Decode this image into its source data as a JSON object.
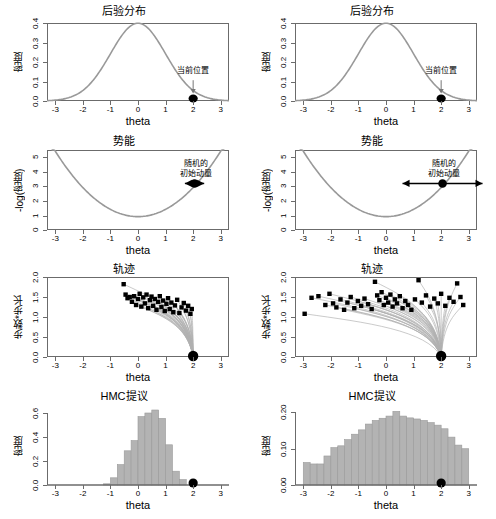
{
  "figure": {
    "xlabel": "theta",
    "columns": [
      "left",
      "right"
    ],
    "rows": 4
  },
  "chart_data": [
    {
      "id": "posterior-left",
      "type": "line",
      "title": "后验分布",
      "xlabel": "theta",
      "ylabel": "密度",
      "xlim": [
        -3.3,
        3.3
      ],
      "ylim": [
        0,
        0.4
      ],
      "xticks": [
        "-3",
        "-2",
        "-1",
        "0",
        "1",
        "2",
        "3"
      ],
      "xtickvals": [
        -3,
        -2,
        -1,
        0,
        1,
        2,
        3
      ],
      "yticks": [
        "0.0",
        "0.1",
        "0.2",
        "0.3",
        "0.4"
      ],
      "ytickvals": [
        0.0,
        0.1,
        0.2,
        0.3,
        0.4
      ],
      "curve": "standard normal density, mean 0, sd 1, peak 0.399 at theta=0",
      "grid": false,
      "points": [
        {
          "x": 2.0,
          "y": 0.0,
          "label": "current position"
        }
      ],
      "annotations": [
        {
          "text": "当前位置",
          "x": 2.0,
          "y": 0.13,
          "arrow": "down"
        }
      ]
    },
    {
      "id": "posterior-right",
      "type": "line",
      "title": "后验分布",
      "xlabel": "theta",
      "ylabel": "密度",
      "xlim": [
        -3.3,
        3.3
      ],
      "ylim": [
        0,
        0.4
      ],
      "xticks": [
        "-3",
        "-2",
        "-1",
        "0",
        "1",
        "2",
        "3"
      ],
      "xtickvals": [
        -3,
        -2,
        -1,
        0,
        1,
        2,
        3
      ],
      "yticks": [
        "0.0",
        "0.1",
        "0.2",
        "0.3",
        "0.4"
      ],
      "ytickvals": [
        0.0,
        0.1,
        0.2,
        0.3,
        0.4
      ],
      "curve": "standard normal density, mean 0, sd 1, peak 0.399 at theta=0",
      "grid": false,
      "points": [
        {
          "x": 2.0,
          "y": 0.0,
          "label": "current position"
        }
      ],
      "annotations": [
        {
          "text": "当前位置",
          "x": 2.0,
          "y": 0.13,
          "arrow": "down"
        }
      ]
    },
    {
      "id": "potential-left",
      "type": "line",
      "title": "势能",
      "xlabel": "theta",
      "ylabel": "-log(密度)",
      "xlim": [
        -3.3,
        3.3
      ],
      "ylim": [
        0,
        5.5
      ],
      "xticks": [
        "-3",
        "-2",
        "-1",
        "0",
        "1",
        "2",
        "3"
      ],
      "xtickvals": [
        -3,
        -2,
        -1,
        0,
        1,
        2,
        3
      ],
      "yticks": [
        "0",
        "1",
        "2",
        "3",
        "4",
        "5"
      ],
      "ytickvals": [
        0,
        1,
        2,
        3,
        4,
        5
      ],
      "curve": "parabola U = 0.5*theta^2 + 0.919, minimum 0.92 at theta=0",
      "grid": false,
      "points": [
        {
          "x": 2.05,
          "y": 3.2,
          "label": "particle"
        }
      ],
      "annotations": [
        {
          "text_line1": "随机的",
          "text_line2": "初始动量",
          "x": 2.1,
          "y": 4.3,
          "arrow": "double-horizontal",
          "arrow_halfwidth": 0.35
        }
      ]
    },
    {
      "id": "potential-right",
      "type": "line",
      "title": "势能",
      "xlabel": "theta",
      "ylabel": "-log(密度)",
      "xlim": [
        -3.3,
        3.3
      ],
      "ylim": [
        0,
        5.5
      ],
      "xticks": [
        "-3",
        "-2",
        "-1",
        "0",
        "1",
        "2",
        "3"
      ],
      "xtickvals": [
        -3,
        -2,
        -1,
        0,
        1,
        2,
        3
      ],
      "yticks": [
        "0",
        "1",
        "2",
        "3",
        "4",
        "5"
      ],
      "ytickvals": [
        0,
        1,
        2,
        3,
        4,
        5
      ],
      "curve": "parabola U = 0.5*theta^2 + 0.919, minimum 0.92 at theta=0",
      "grid": false,
      "points": [
        {
          "x": 2.05,
          "y": 3.2,
          "label": "particle"
        }
      ],
      "annotations": [
        {
          "text_line1": "随机的",
          "text_line2": "初始动量",
          "x": 2.1,
          "y": 4.3,
          "arrow": "double-horizontal",
          "arrow_halfwidth": 1.45
        }
      ]
    },
    {
      "id": "trajectory-left",
      "type": "line",
      "title": "轨迹",
      "xlabel": "theta",
      "ylabel": "步数*步长",
      "xlim": [
        -3.3,
        3.3
      ],
      "ylim": [
        0,
        2.0
      ],
      "xticks": [
        "-3",
        "-2",
        "-1",
        "0",
        "1",
        "2",
        "3"
      ],
      "xtickvals": [
        -3,
        -2,
        -1,
        0,
        1,
        2,
        3
      ],
      "yticks": [
        "0.0",
        "0.5",
        "1.0",
        "1.5",
        "2.0"
      ],
      "ytickvals": [
        0.0,
        0.5,
        1.0,
        1.5,
        2.0
      ],
      "grid": false,
      "description": "short leapfrog trajectories fanning from start point up and to the left, endpoints clustered near theta -0.6 to 2.0",
      "start_point": {
        "x": 2.0,
        "y": 0.0
      },
      "endpoints": [
        {
          "x": -0.52,
          "y": 1.82
        },
        {
          "x": -0.45,
          "y": 1.56
        },
        {
          "x": -0.38,
          "y": 1.47
        },
        {
          "x": -0.3,
          "y": 1.5
        },
        {
          "x": -0.22,
          "y": 1.38
        },
        {
          "x": -0.14,
          "y": 1.52
        },
        {
          "x": -0.07,
          "y": 1.3
        },
        {
          "x": 0.0,
          "y": 1.45
        },
        {
          "x": 0.06,
          "y": 1.58
        },
        {
          "x": 0.12,
          "y": 1.26
        },
        {
          "x": 0.19,
          "y": 1.49
        },
        {
          "x": 0.25,
          "y": 1.34
        },
        {
          "x": 0.31,
          "y": 1.56
        },
        {
          "x": 0.37,
          "y": 1.22
        },
        {
          "x": 0.43,
          "y": 1.42
        },
        {
          "x": 0.49,
          "y": 1.51
        },
        {
          "x": 0.55,
          "y": 1.28
        },
        {
          "x": 0.61,
          "y": 1.45
        },
        {
          "x": 0.67,
          "y": 1.18
        },
        {
          "x": 0.73,
          "y": 1.38
        },
        {
          "x": 0.79,
          "y": 1.52
        },
        {
          "x": 0.85,
          "y": 1.25
        },
        {
          "x": 0.91,
          "y": 1.41
        },
        {
          "x": 0.97,
          "y": 1.15
        },
        {
          "x": 1.03,
          "y": 1.33
        },
        {
          "x": 1.09,
          "y": 1.47
        },
        {
          "x": 1.15,
          "y": 1.2
        },
        {
          "x": 1.21,
          "y": 1.36
        },
        {
          "x": 1.28,
          "y": 1.12
        },
        {
          "x": 1.34,
          "y": 1.29
        },
        {
          "x": 1.42,
          "y": 1.43
        },
        {
          "x": 1.5,
          "y": 1.1
        },
        {
          "x": 1.58,
          "y": 1.24
        },
        {
          "x": 1.66,
          "y": 1.35
        },
        {
          "x": 1.74,
          "y": 1.16
        },
        {
          "x": 1.82,
          "y": 1.28
        },
        {
          "x": 1.9,
          "y": 1.08
        },
        {
          "x": 1.95,
          "y": 1.2
        }
      ]
    },
    {
      "id": "trajectory-right",
      "type": "line",
      "title": "轨迹",
      "xlabel": "theta",
      "ylabel": "步数*步长",
      "xlim": [
        -3.3,
        3.3
      ],
      "ylim": [
        0,
        2.0
      ],
      "xticks": [
        "-3",
        "-2",
        "-1",
        "0",
        "1",
        "2",
        "3"
      ],
      "xtickvals": [
        -3,
        -2,
        -1,
        0,
        1,
        2,
        3
      ],
      "yticks": [
        "0.0",
        "0.5",
        "1.0",
        "1.5",
        "2.0"
      ],
      "ytickvals": [
        0.0,
        0.5,
        1.0,
        1.5,
        2.0
      ],
      "grid": false,
      "description": "long leapfrog trajectories fanning from start point across the full theta range, endpoints spread from -3 to 2.8",
      "start_point": {
        "x": 2.0,
        "y": 0.0
      },
      "endpoints": [
        {
          "x": -2.95,
          "y": 1.08
        },
        {
          "x": -2.7,
          "y": 1.48
        },
        {
          "x": -2.45,
          "y": 1.52
        },
        {
          "x": -2.2,
          "y": 1.3
        },
        {
          "x": -2.05,
          "y": 1.58
        },
        {
          "x": -1.92,
          "y": 1.34
        },
        {
          "x": -1.8,
          "y": 1.24
        },
        {
          "x": -1.65,
          "y": 1.44
        },
        {
          "x": -1.52,
          "y": 1.18
        },
        {
          "x": -1.4,
          "y": 1.36
        },
        {
          "x": -1.28,
          "y": 1.5
        },
        {
          "x": -1.15,
          "y": 1.22
        },
        {
          "x": -1.02,
          "y": 1.4
        },
        {
          "x": -0.9,
          "y": 1.28
        },
        {
          "x": -0.78,
          "y": 1.46
        },
        {
          "x": -0.65,
          "y": 1.32
        },
        {
          "x": -0.52,
          "y": 1.2
        },
        {
          "x": -0.4,
          "y": 1.88
        },
        {
          "x": -0.32,
          "y": 1.54
        },
        {
          "x": -0.24,
          "y": 1.42
        },
        {
          "x": -0.16,
          "y": 1.62
        },
        {
          "x": -0.08,
          "y": 1.3
        },
        {
          "x": 0.0,
          "y": 1.48
        },
        {
          "x": 0.08,
          "y": 1.36
        },
        {
          "x": 0.16,
          "y": 1.56
        },
        {
          "x": 0.24,
          "y": 1.26
        },
        {
          "x": 0.32,
          "y": 1.44
        },
        {
          "x": 0.4,
          "y": 1.34
        },
        {
          "x": 0.5,
          "y": 1.52
        },
        {
          "x": 0.6,
          "y": 1.22
        },
        {
          "x": 0.7,
          "y": 1.4
        },
        {
          "x": 0.8,
          "y": 1.3
        },
        {
          "x": 0.92,
          "y": 1.18
        },
        {
          "x": 1.05,
          "y": 1.44
        },
        {
          "x": 1.18,
          "y": 1.92
        },
        {
          "x": 1.3,
          "y": 1.36
        },
        {
          "x": 1.45,
          "y": 1.54
        },
        {
          "x": 1.6,
          "y": 1.26
        },
        {
          "x": 1.75,
          "y": 1.46
        },
        {
          "x": 1.88,
          "y": 1.34
        },
        {
          "x": 2.0,
          "y": 1.58
        },
        {
          "x": 2.15,
          "y": 1.28
        },
        {
          "x": 2.3,
          "y": 1.48
        },
        {
          "x": 2.45,
          "y": 1.38
        },
        {
          "x": 2.58,
          "y": 1.84
        },
        {
          "x": 2.7,
          "y": 1.5
        },
        {
          "x": 2.8,
          "y": 1.3
        }
      ]
    },
    {
      "id": "hmc-proposal-left",
      "type": "bar",
      "title": "HMC提议",
      "xlabel": "theta",
      "ylabel": "密度",
      "xlim": [
        -3.3,
        3.3
      ],
      "ylim": [
        0,
        0.65
      ],
      "xticks": [
        "-3",
        "-2",
        "-1",
        "0",
        "1",
        "2",
        "3"
      ],
      "xtickvals": [
        -3,
        -2,
        -1,
        0,
        1,
        2,
        3
      ],
      "yticks": [
        "0.0",
        "0.2",
        "0.4",
        "0.6"
      ],
      "ytickvals": [
        0.0,
        0.2,
        0.4,
        0.6
      ],
      "grid": false,
      "bin_width": 0.25,
      "bin_starts": [
        -1.25,
        -1.0,
        -0.75,
        -0.5,
        -0.25,
        0.0,
        0.25,
        0.5,
        0.75,
        1.0,
        1.25,
        1.5
      ],
      "categories": [
        "-1.25",
        "-1.00",
        "-0.75",
        "-0.50",
        "-0.25",
        "0.00",
        "0.25",
        "0.50",
        "0.75",
        "1.00",
        "1.25",
        "1.50"
      ],
      "values": [
        0.01,
        0.06,
        0.17,
        0.285,
        0.37,
        0.57,
        0.6,
        0.625,
        0.555,
        0.335,
        0.115,
        0.045
      ],
      "points": [
        {
          "x": 2.0,
          "y": 0.0,
          "label": "current position"
        }
      ]
    },
    {
      "id": "hmc-proposal-right",
      "type": "bar",
      "title": "HMC提议",
      "xlabel": "theta",
      "ylabel": "密度",
      "xlim": [
        -3.3,
        3.3
      ],
      "ylim": [
        0,
        0.215
      ],
      "xticks": [
        "-3",
        "-2",
        "-1",
        "0",
        "1",
        "2",
        "3"
      ],
      "xtickvals": [
        -3,
        -2,
        -1,
        0,
        1,
        2,
        3
      ],
      "yticks": [
        "0.00",
        "0.10",
        "0.20"
      ],
      "ytickvals": [
        0.0,
        0.1,
        0.2
      ],
      "grid": false,
      "bin_width": 0.25,
      "bin_starts": [
        -3.0,
        -2.75,
        -2.5,
        -2.25,
        -2.0,
        -1.75,
        -1.5,
        -1.25,
        -1.0,
        -0.75,
        -0.5,
        -0.25,
        0.0,
        0.25,
        0.5,
        0.75,
        1.0,
        1.25,
        1.5,
        1.75,
        2.0,
        2.25,
        2.5,
        2.75
      ],
      "categories": [
        "-3.00",
        "-2.75",
        "-2.50",
        "-2.25",
        "-2.00",
        "-1.75",
        "-1.50",
        "-1.25",
        "-1.00",
        "-0.75",
        "-0.50",
        "-0.25",
        "0.00",
        "0.25",
        "0.50",
        "0.75",
        "1.00",
        "1.25",
        "1.50",
        "1.75",
        "2.00",
        "2.25",
        "2.50",
        "2.75"
      ],
      "values": [
        0.062,
        0.058,
        0.058,
        0.08,
        0.103,
        0.108,
        0.125,
        0.14,
        0.152,
        0.168,
        0.178,
        0.184,
        0.19,
        0.203,
        0.19,
        0.185,
        0.182,
        0.178,
        0.172,
        0.165,
        0.155,
        0.132,
        0.11,
        0.1
      ],
      "points": [
        {
          "x": 2.0,
          "y": 0.0,
          "label": "current position"
        }
      ]
    }
  ],
  "colors": {
    "curve": "#999999",
    "bar_fill": "#b3b3b3",
    "bar_border": "#9a9a9a",
    "point": "#000000",
    "axis": "#6b6b6b",
    "trajectory": "#b0b0b0",
    "background": "#ffffff"
  }
}
